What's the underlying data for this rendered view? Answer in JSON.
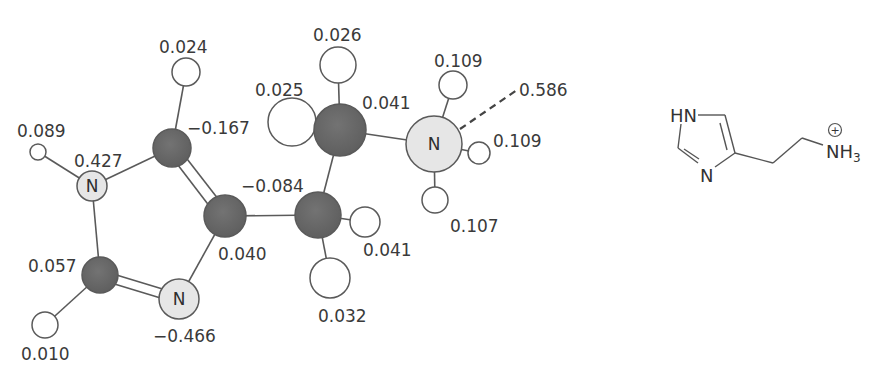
{
  "colors": {
    "carbon": "#6b6b6b",
    "nitrogen": "#e6e6e6",
    "hydrogen": "#ffffff",
    "stroke": "#5a5a5a",
    "label": "#3a3a3a"
  },
  "ball_and_stick": {
    "atoms": [
      {
        "id": "N1",
        "element": "N",
        "symbol": "N",
        "charge_label": "0.427"
      },
      {
        "id": "H_N1",
        "element": "H",
        "charge_label": "0.089"
      },
      {
        "id": "C5",
        "element": "C",
        "charge_label": "−0.167"
      },
      {
        "id": "H_C5",
        "element": "H",
        "charge_label": "0.024"
      },
      {
        "id": "C4",
        "element": "C",
        "charge_label": "0.040"
      },
      {
        "id": "N3",
        "element": "N",
        "symbol": "N",
        "charge_label": "−0.466"
      },
      {
        "id": "C2",
        "element": "C",
        "charge_label": "0.057"
      },
      {
        "id": "H_C2",
        "element": "H",
        "charge_label": "0.010"
      },
      {
        "id": "Cb",
        "element": "C",
        "charge_label": "−0.084"
      },
      {
        "id": "H_Cb1",
        "element": "H",
        "charge_label": "0.041"
      },
      {
        "id": "H_Cb2",
        "element": "H",
        "charge_label": "0.032"
      },
      {
        "id": "Ca",
        "element": "C",
        "charge_label": "0.041"
      },
      {
        "id": "H_Ca1",
        "element": "H",
        "charge_label": "0.025"
      },
      {
        "id": "H_Ca2",
        "element": "H",
        "charge_label": "0.026"
      },
      {
        "id": "Nam",
        "element": "N",
        "symbol": "N",
        "charge_label": "0.586"
      },
      {
        "id": "H_Nam1",
        "element": "H",
        "charge_label": "0.109"
      },
      {
        "id": "H_Nam2",
        "element": "H",
        "charge_label": "0.109"
      },
      {
        "id": "H_Nam3",
        "element": "H",
        "charge_label": "0.107"
      }
    ]
  },
  "skeletal_formula": {
    "ring_nh": "HN",
    "ring_n": "N",
    "amine_n": "N",
    "amine_h": "H",
    "amine_h_count": "3",
    "charge": "+"
  }
}
